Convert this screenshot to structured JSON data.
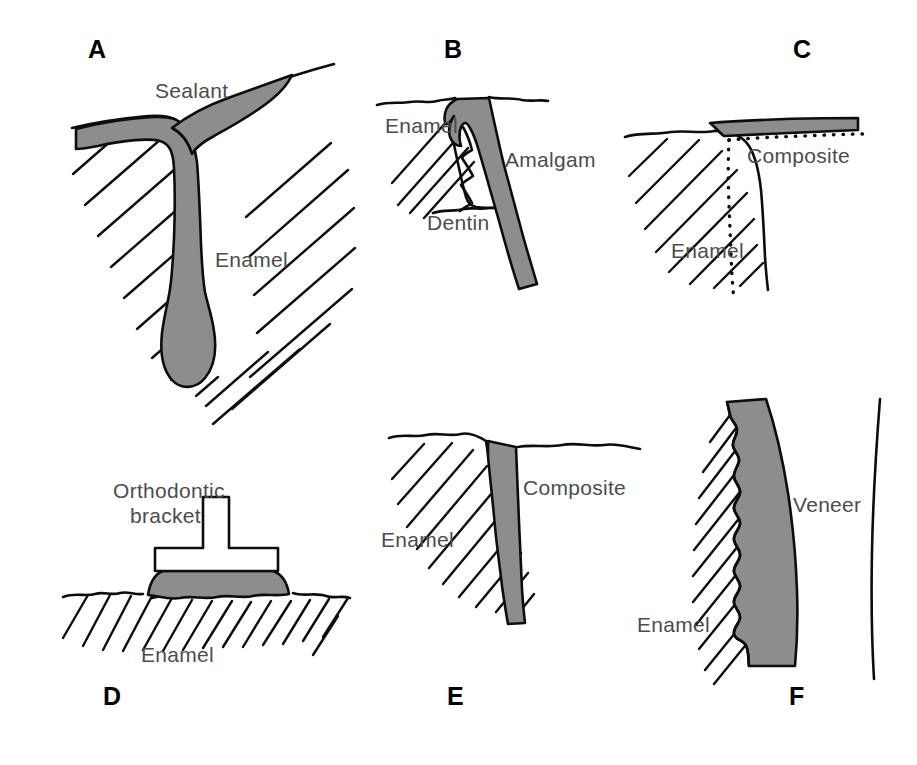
{
  "figure": {
    "background_color": "#ffffff",
    "ink_color": "#0d0d0d",
    "label_color": "#4c4c4c",
    "material_fill_color": "#8d8d8d",
    "panel_count": 6
  },
  "panels": [
    {
      "id": "A",
      "letter": "A",
      "subject": "pit-and-fissure sealant",
      "labels": [
        {
          "text": "Sealant",
          "x": 155,
          "y": 98
        },
        {
          "text": "Enamel",
          "x": 215,
          "y": 267
        }
      ]
    },
    {
      "id": "B",
      "letter": "B",
      "subject": "bonded amalgam restoration",
      "labels": [
        {
          "text": "Enamel",
          "x": 385,
          "y": 133
        },
        {
          "text": "Amalgam",
          "x": 505,
          "y": 167
        },
        {
          "text": "Dentin",
          "x": 427,
          "y": 230
        }
      ]
    },
    {
      "id": "C",
      "letter": "C",
      "subject": "composite restoration with beveled enamel margin",
      "labels": [
        {
          "text": "Composite",
          "x": 747,
          "y": 163
        },
        {
          "text": "Enamel",
          "x": 671,
          "y": 258
        }
      ]
    },
    {
      "id": "D",
      "letter": "D",
      "subject": "bonded orthodontic bracket",
      "labels": [
        {
          "text": "Orthodontic",
          "x": 113,
          "y": 498
        },
        {
          "text": "bracket",
          "x": 130,
          "y": 523
        },
        {
          "text": "Enamel",
          "x": 141,
          "y": 662
        }
      ]
    },
    {
      "id": "E",
      "letter": "E",
      "subject": "composite restoration at a cavosurface margin",
      "labels": [
        {
          "text": "Composite",
          "x": 523,
          "y": 495
        },
        {
          "text": "Enamel",
          "x": 381,
          "y": 547
        }
      ]
    },
    {
      "id": "F",
      "letter": "F",
      "subject": "porcelain or composite veneer on etched enamel",
      "labels": [
        {
          "text": "Veneer",
          "x": 793,
          "y": 512
        },
        {
          "text": "Enamel",
          "x": 637,
          "y": 632
        }
      ]
    }
  ],
  "panel_letters": [
    {
      "text": "A",
      "x": 88,
      "y": 58
    },
    {
      "text": "B",
      "x": 444,
      "y": 58
    },
    {
      "text": "C",
      "x": 793,
      "y": 58
    },
    {
      "text": "D",
      "x": 103,
      "y": 705
    },
    {
      "text": "E",
      "x": 447,
      "y": 705
    },
    {
      "text": "F",
      "x": 789,
      "y": 705
    }
  ]
}
